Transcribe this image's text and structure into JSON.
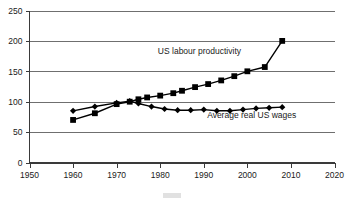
{
  "chart_data": {
    "type": "line",
    "title": "",
    "subtitle": "",
    "xlabel": "",
    "ylabel": "",
    "xlim": [
      1950,
      2020
    ],
    "ylim": [
      0,
      250
    ],
    "xticks": [
      1950,
      1960,
      1970,
      1980,
      1990,
      2000,
      2010,
      2020
    ],
    "yticks": [
      0,
      50,
      100,
      150,
      200,
      250
    ],
    "xtick_labels": [
      "1950",
      "1960",
      "1970",
      "1980",
      "1990",
      "2000",
      "2010",
      "2020"
    ],
    "ytick_labels": [
      "0",
      "50",
      "100",
      "150",
      "200",
      "250"
    ],
    "grid": "horizontal",
    "legend_position": "inline-annotation",
    "index_base": "1973 = 100",
    "series": [
      {
        "name": "US labour productivity",
        "marker": "square",
        "label_x": 1989,
        "label_y": 178,
        "x": [
          1960,
          1965,
          1970,
          1973,
          1975,
          1977,
          1980,
          1983,
          1985,
          1988,
          1991,
          1994,
          1997,
          2000,
          2004,
          2008
        ],
        "values": [
          70,
          81,
          96,
          100,
          104,
          107,
          110,
          114,
          118,
          124,
          129,
          135,
          142,
          150,
          157,
          200
        ]
      },
      {
        "name": "Average real US wages",
        "marker": "diamond",
        "label_x": 2001,
        "label_y": 73,
        "x": [
          1960,
          1965,
          1970,
          1973,
          1975,
          1978,
          1981,
          1984,
          1987,
          1990,
          1993,
          1996,
          1999,
          2002,
          2005,
          2008
        ],
        "values": [
          85,
          92,
          98,
          101,
          97,
          92,
          88,
          86,
          86,
          87,
          85,
          85,
          87,
          89,
          90,
          91
        ]
      }
    ],
    "annotations": [
      {
        "text": "US labour productivity",
        "x": 1989,
        "y": 178
      },
      {
        "text": "Average real US wages",
        "x": 2001,
        "y": 73
      }
    ]
  },
  "colors": {
    "background": "#ffffff",
    "gridline": "#6f6f6f",
    "axis": "#3a3a3a",
    "series_line": "#000000",
    "text": "#1a1a1a"
  }
}
